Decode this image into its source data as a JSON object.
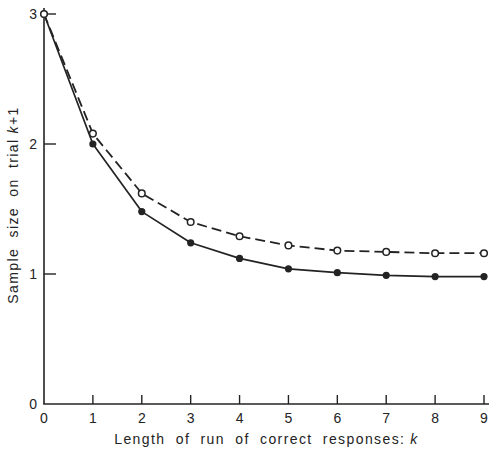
{
  "chart_data": {
    "type": "line",
    "title": "",
    "xlabel": "Length of run of correct responses:",
    "xlabel_var": "k",
    "ylabel": "Sample size on trial",
    "ylabel_var": "k",
    "ylabel_suffix": "+1",
    "x": [
      0,
      1,
      2,
      3,
      4,
      5,
      6,
      7,
      8,
      9
    ],
    "series": [
      {
        "name": "solid-filled-circles",
        "line": "solid",
        "marker": "filled-circle",
        "values": [
          3.0,
          2.0,
          1.48,
          1.24,
          1.12,
          1.04,
          1.01,
          0.99,
          0.98,
          0.98
        ]
      },
      {
        "name": "dashed-open-circles",
        "line": "dashed",
        "marker": "open-circle",
        "values": [
          3.0,
          2.08,
          1.62,
          1.4,
          1.29,
          1.22,
          1.18,
          1.17,
          1.16,
          1.16
        ]
      }
    ],
    "x_ticks": [
      0,
      1,
      2,
      3,
      4,
      5,
      6,
      7,
      8,
      9
    ],
    "y_ticks": [
      0,
      1,
      2,
      3
    ],
    "xlim": [
      0,
      9
    ],
    "ylim": [
      0,
      3
    ],
    "grid": false,
    "legend": "none",
    "ink_color": "#232323",
    "background": "#ffffff"
  }
}
